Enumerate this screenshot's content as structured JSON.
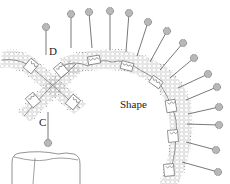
{
  "diagram": {
    "labels": {
      "d": "D",
      "c": "C",
      "shape": "Shape"
    },
    "colors": {
      "stroke": "#555555",
      "pin_head_fill": "#b8b8b8",
      "pin_head_stroke": "#666666",
      "hex_stroke": "#a8a8a8",
      "background": "#ffffff"
    },
    "pins": [
      {
        "head": [
          46,
          27
        ],
        "foot": [
          46,
          55
        ],
        "name": "pin-d"
      },
      {
        "head": [
          71,
          14
        ],
        "foot": [
          71,
          48
        ]
      },
      {
        "head": [
          89,
          12
        ],
        "foot": [
          92,
          48
        ]
      },
      {
        "head": [
          110,
          11
        ],
        "foot": [
          110,
          50
        ]
      },
      {
        "head": [
          129,
          13
        ],
        "foot": [
          126,
          52
        ]
      },
      {
        "head": [
          148,
          22
        ],
        "foot": [
          137,
          56
        ]
      },
      {
        "head": [
          167,
          31
        ],
        "foot": [
          150,
          62
        ]
      },
      {
        "head": [
          183,
          43
        ],
        "foot": [
          160,
          70
        ]
      },
      {
        "head": [
          194,
          58
        ],
        "foot": [
          170,
          78
        ]
      },
      {
        "head": [
          208,
          74
        ],
        "foot": [
          178,
          88
        ]
      },
      {
        "head": [
          217,
          87
        ],
        "foot": [
          186,
          100
        ]
      },
      {
        "head": [
          219,
          107
        ],
        "foot": [
          188,
          114
        ]
      },
      {
        "head": [
          219,
          125
        ],
        "foot": [
          187,
          124
        ]
      },
      {
        "head": [
          216,
          150
        ],
        "foot": [
          186,
          142
        ]
      },
      {
        "head": [
          218,
          172
        ],
        "foot": [
          182,
          162
        ]
      },
      {
        "head": [
          48,
          143
        ],
        "foot": [
          48,
          112
        ],
        "name": "pin-c"
      }
    ]
  }
}
